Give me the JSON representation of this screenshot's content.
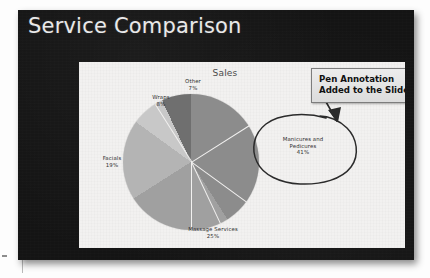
{
  "slide": {
    "title": "Service Comparison",
    "background_color": "#141414",
    "title_color": "#e9e9e9"
  },
  "callout": {
    "line1": "Pen Annotation",
    "line2": "Added to the Slide",
    "fill_color": "#e2e2e2",
    "border_color": "#7d7d7d"
  },
  "annotation": {
    "type": "pen-ink",
    "shapes": [
      "ellipse-around-manicures-label",
      "arrow-from-callout-to-ellipse"
    ],
    "ink_color": "#2b2b2b"
  },
  "chart_data": {
    "type": "pie",
    "title": "Sales",
    "xlabel": "",
    "ylabel": "",
    "legend": "none",
    "labels_position": "outside-with-leader",
    "start_angle_deg": 0,
    "direction": "clockwise",
    "categories": [
      "Manicures and Pedicures",
      "Massage Services",
      "Facials",
      "Wraps",
      "Other"
    ],
    "values": [
      41,
      25,
      19,
      8,
      7
    ],
    "value_unit": "%",
    "slice_colors": [
      "#8c8c8c",
      "#a0a0a0",
      "#b4b4b4",
      "#c8c8c8",
      "#6f6f6f"
    ],
    "data_labels": [
      {
        "name": "Manicures and Pedicures",
        "value": 41,
        "text": "Manicures and",
        "text2": "Pedicures",
        "pct": "41%"
      },
      {
        "name": "Massage Services",
        "value": 25,
        "text": "Massage Services",
        "pct": "25%"
      },
      {
        "name": "Facials",
        "value": 19,
        "text": "Facials",
        "pct": "19%"
      },
      {
        "name": "Wraps",
        "value": 8,
        "text": "Wraps",
        "pct": "8%"
      },
      {
        "name": "Other",
        "value": 7,
        "text": "Other",
        "pct": "7%"
      }
    ]
  }
}
